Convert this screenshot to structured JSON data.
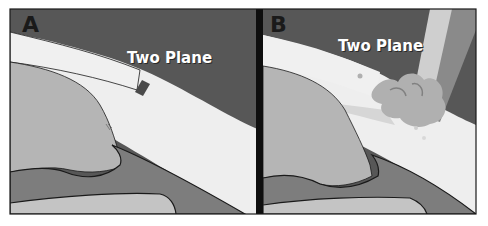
{
  "figure": {
    "panels": [
      {
        "letter": "A",
        "title": "Two Plane"
      },
      {
        "letter": "B",
        "title": "Two Plane"
      }
    ]
  },
  "colors": {
    "background": "#575757",
    "cornea_light": "#eeeeee",
    "tissue_mid": "#b5b5b5",
    "tissue_dark": "#7d7d7d",
    "tissue_lower": "#c4c4c4",
    "outline": "#1a1a1a",
    "divider": "#0e0e0e",
    "instrument_light": "#cfcfcf",
    "instrument_dark": "#8a8a8a"
  }
}
